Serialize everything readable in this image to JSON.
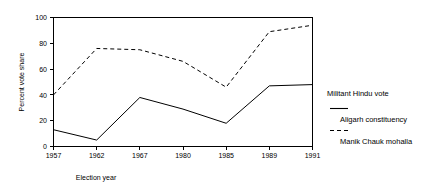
{
  "chart_data": {
    "type": "line",
    "title": "",
    "xlabel": "Election year",
    "ylabel": "Percent vote share",
    "categories": [
      "1957",
      "1962",
      "1967",
      "1980",
      "1985",
      "1989",
      "1991"
    ],
    "x_tick_labels": [
      "1957",
      "1962",
      "1967",
      "1980",
      "1985",
      "1989",
      "1991"
    ],
    "y_tick_labels": [
      "0",
      "20",
      "40",
      "60",
      "80",
      "100"
    ],
    "y_ticks": [
      0,
      20,
      40,
      60,
      80,
      100
    ],
    "ylim": [
      0,
      100
    ],
    "grid": false,
    "legend_position": "right",
    "legend_title": "Militant Hindu vote",
    "series": [
      {
        "name": "Aligarh constituency",
        "style": "solid",
        "color": "#000000",
        "values": [
          13,
          5,
          38,
          29,
          18,
          47,
          48
        ]
      },
      {
        "name": "Manik Chauk mohalla",
        "style": "dashed",
        "color": "#000000",
        "values": [
          40,
          76,
          75,
          66,
          46,
          89,
          94
        ]
      }
    ]
  },
  "legend": {
    "title": "Militant Hindu vote",
    "entries": [
      {
        "label": "Aligarh constituency",
        "style": "solid"
      },
      {
        "label": "Manik Chauk mohalla",
        "style": "dashed"
      }
    ]
  },
  "axes": {
    "x_title": "Election year",
    "y_title": "Percent vote share",
    "x_labels": [
      "1957",
      "1962",
      "1967",
      "1980",
      "1985",
      "1989",
      "1991"
    ],
    "y_labels": [
      "100",
      "80",
      "60",
      "40",
      "20",
      "0"
    ]
  }
}
